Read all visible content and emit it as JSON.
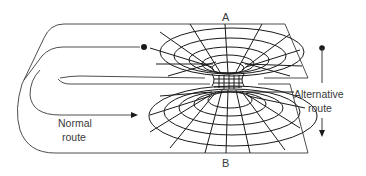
{
  "diagram": {
    "labels": {
      "point_a": "A",
      "point_b": "B",
      "normal_route_line1": "Normal",
      "normal_route_line2": "route",
      "alternative_route_line1": "Alternative",
      "alternative_route_line2": "route"
    },
    "colors": {
      "line": "#1a1a1a",
      "edge": "#3a3a3a",
      "text": "#3a3a3a",
      "background": "#ffffff"
    }
  }
}
